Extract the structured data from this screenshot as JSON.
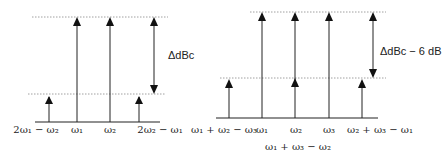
{
  "left_diagram": {
    "delta_label": "ΔdBc",
    "tones": [
      {
        "label": "2ω₁ − ω₂",
        "level": "low"
      },
      {
        "label": "ω₁",
        "level": "high"
      },
      {
        "label": "ω₂",
        "level": "high"
      },
      {
        "label": "2ω₂ − ω₁",
        "level": "low"
      }
    ]
  },
  "right_diagram": {
    "delta_label": "ΔdBc − 6 dB",
    "tones": [
      {
        "label": "ω₁ + ω₂ − ω₃",
        "level": "low"
      },
      {
        "label": "ω₁",
        "level": "high"
      },
      {
        "label": "ω₂",
        "level": "high"
      },
      {
        "label": "ω₃",
        "level": "high"
      },
      {
        "label": "ω₂ + ω₃ − ω₁",
        "level": "low"
      }
    ],
    "overlap_label": "ω₁ + ω₃ − ω₂",
    "overlap_level": "low"
  }
}
